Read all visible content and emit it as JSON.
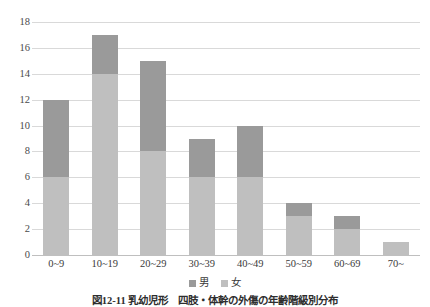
{
  "chart_data": {
    "type": "bar",
    "subtype": "stacked-vertical",
    "title": "",
    "xlabel": "",
    "ylabel": "",
    "ylim": [
      0,
      18
    ],
    "ytick_step": 2,
    "yticks": [
      18,
      16,
      14,
      12,
      10,
      8,
      6,
      4,
      2,
      0
    ],
    "grid": true,
    "legend_position": "bottom-center",
    "categories": [
      "0~9",
      "10~19",
      "20~29",
      "30~39",
      "40~49",
      "50~59",
      "60~69",
      "70~"
    ],
    "series": [
      {
        "name": "女",
        "color": "#bfbfbf",
        "values": [
          6,
          14,
          8,
          6,
          6,
          3,
          2,
          1
        ]
      },
      {
        "name": "男",
        "color": "#9a9a9a",
        "values": [
          6,
          3,
          7,
          3,
          4,
          1,
          1,
          0
        ]
      }
    ],
    "totals": [
      12,
      17,
      15,
      9,
      10,
      4,
      3,
      1
    ]
  },
  "legend": {
    "items": [
      {
        "label": "男",
        "color": "#9a9a9a",
        "swatch_icon": "square-swatch-icon"
      },
      {
        "label": "女",
        "color": "#bfbfbf",
        "swatch_icon": "square-swatch-icon"
      }
    ]
  },
  "caption": {
    "text": "図12-11 乳幼児形　四肢・体幹の外傷の年齢階級別分布"
  }
}
